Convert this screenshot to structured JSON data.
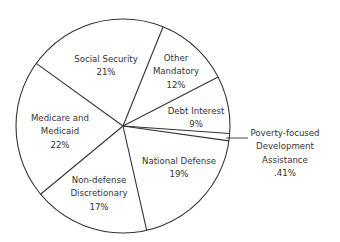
{
  "chart_data": {
    "type": "pie",
    "title": "",
    "center": [
      123,
      126
    ],
    "radius": 107,
    "start_angle_deg": 27.3,
    "slices": [
      {
        "label": "Other Mandatory",
        "lines": [
          "Other",
          "Mandatory",
          "12%"
        ],
        "value": 12,
        "pct_label": "12%",
        "label_pos": [
          176,
          58
        ]
      },
      {
        "label": "Social Security",
        "lines": [
          "Social Security",
          "21%"
        ],
        "value": 21,
        "pct_label": "21%",
        "label_pos": [
          106,
          59
        ]
      },
      {
        "label": "Medicare and Medicaid",
        "lines": [
          "Medicare and",
          "Medicaid",
          "22%"
        ],
        "value": 22,
        "pct_label": "22%",
        "label_pos": [
          60,
          118
        ]
      },
      {
        "label": "Non-defense Discretionary",
        "lines": [
          "Non-defense",
          "Discretionary",
          "17%"
        ],
        "value": 17,
        "pct_label": "17%",
        "label_pos": [
          99,
          180
        ]
      },
      {
        "label": "National Defense",
        "lines": [
          "National Defense",
          "19%"
        ],
        "value": 19,
        "pct_label": "19%",
        "label_pos": [
          179,
          161
        ]
      },
      {
        "label": "Poverty-focused Development Assistance",
        "lines": [
          "Poverty-focused",
          "Development",
          "Assistance",
          ".41%"
        ],
        "value": 0.41,
        "pct_label": ".41%",
        "label_pos": [
          285,
          133
        ],
        "external": true,
        "leader": [
          [
            226,
            138
          ],
          [
            248,
            138
          ]
        ]
      },
      {
        "label": "Debt Interest",
        "lines": [
          "Debt Interest",
          "9%"
        ],
        "value": 9,
        "pct_label": "9%",
        "label_pos": [
          196,
          111
        ]
      }
    ],
    "boundary_angles_deg": [
      27.3,
      68,
      144.2,
      219.6,
      282.8,
      352,
      356
    ],
    "colors": {
      "fill": "#ffffff",
      "stroke": "#333333",
      "text": "#333333"
    },
    "legend": "none"
  }
}
